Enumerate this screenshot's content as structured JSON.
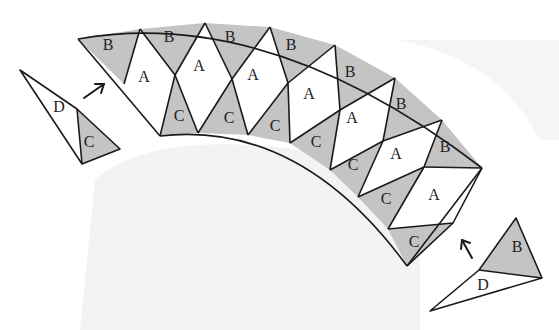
{
  "diagram": {
    "colors": {
      "shaded": "#c4c4c4",
      "unshaded": "#ffffff",
      "lines": "#1a1a1a",
      "background_shadow": "#f0f0f0"
    },
    "arc_pieces": [
      {
        "label": "B",
        "shade": "shaded"
      },
      {
        "label": "A",
        "shade": "white"
      },
      {
        "label": "B",
        "shade": "shaded"
      },
      {
        "label": "C",
        "shade": "shaded"
      },
      {
        "label": "A",
        "shade": "white"
      },
      {
        "label": "B",
        "shade": "shaded"
      },
      {
        "label": "C",
        "shade": "shaded"
      },
      {
        "label": "A",
        "shade": "white"
      },
      {
        "label": "B",
        "shade": "shaded"
      },
      {
        "label": "C",
        "shade": "shaded"
      },
      {
        "label": "A",
        "shade": "white"
      },
      {
        "label": "B",
        "shade": "shaded"
      },
      {
        "label": "C",
        "shade": "shaded"
      },
      {
        "label": "A",
        "shade": "white"
      },
      {
        "label": "B",
        "shade": "shaded"
      },
      {
        "label": "C",
        "shade": "shaded"
      },
      {
        "label": "A",
        "shade": "white"
      },
      {
        "label": "B",
        "shade": "shaded"
      },
      {
        "label": "C",
        "shade": "shaded"
      },
      {
        "label": "A",
        "shade": "white"
      },
      {
        "label": "C",
        "shade": "shaded"
      }
    ],
    "left_unit": {
      "labels": [
        "D",
        "C"
      ],
      "arrow": "up-right"
    },
    "right_unit": {
      "labels": [
        "B",
        "D"
      ],
      "arrow": "up-left"
    },
    "labels": {
      "a": "A",
      "b": "B",
      "c": "C",
      "d": "D"
    }
  }
}
